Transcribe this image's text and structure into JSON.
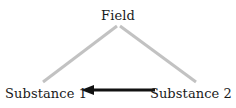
{
  "diagram": {
    "type": "su-field-triangle",
    "background_color": "#ffffff",
    "nodes": {
      "apex": {
        "label": "Field",
        "x": 118,
        "y": 15
      },
      "bottom_left": {
        "label": "Substance 1",
        "x": 41,
        "y": 92
      },
      "bottom_right": {
        "label": "Substance 2",
        "x": 195,
        "y": 92
      }
    },
    "links": [
      {
        "name": "field-to-substance-1",
        "from": "apex",
        "to": "bottom_left",
        "style": "plain-line",
        "color": "#c2c2c2",
        "width": 3,
        "x1": 117,
        "y1": 26,
        "x2": 43,
        "y2": 82
      },
      {
        "name": "field-to-substance-2",
        "from": "apex",
        "to": "bottom_right",
        "style": "plain-line",
        "color": "#c2c2c2",
        "width": 3,
        "x1": 120,
        "y1": 26,
        "x2": 196,
        "y2": 82
      },
      {
        "name": "substance-2-to-substance-1",
        "from": "bottom_right",
        "to": "bottom_left",
        "style": "solid-arrow",
        "color": "#111111",
        "width": 3,
        "x1": 155,
        "y1": 90,
        "x2": 82,
        "y2": 90,
        "arrowhead": {
          "shape": "filled-triangle",
          "tip_x": 81,
          "tip_y": 90,
          "length": 13,
          "half_height": 5
        }
      }
    ]
  }
}
